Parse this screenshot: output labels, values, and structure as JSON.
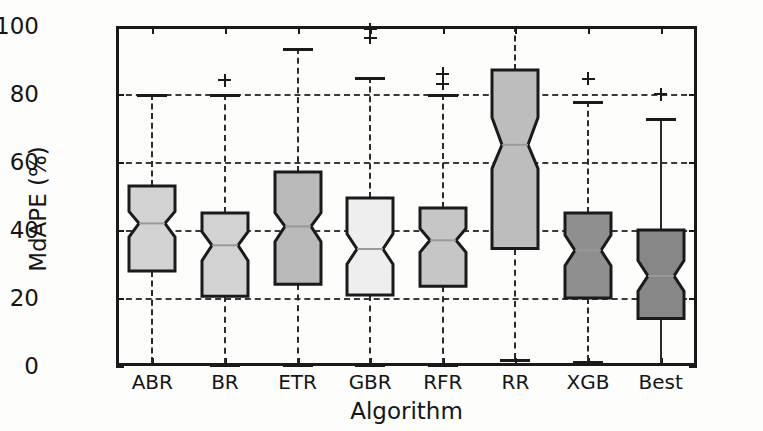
{
  "chart_data": {
    "type": "box",
    "title": "",
    "xlabel": "Algorithm",
    "ylabel": "MdAPE (%)",
    "categories": [
      "ABR",
      "BR",
      "ETR",
      "GBR",
      "RFR",
      "RR",
      "XGB",
      "Best"
    ],
    "ylim": [
      0,
      100
    ],
    "yticks": [
      0,
      20,
      40,
      60,
      80,
      100
    ],
    "ytick_labels": [
      "0",
      "20",
      "40",
      "60",
      "80",
      "100"
    ],
    "grid": true,
    "grid_axis": "y",
    "grid_style": "dashed",
    "legend": null,
    "notched": true,
    "boxes": [
      {
        "label": "ABR",
        "whisker_low": 1.0,
        "q1": 28.0,
        "median": 42.0,
        "q3": 53.0,
        "whisker_high": 80.0,
        "notch_low": 38.0,
        "notch_high": 45.5,
        "outliers": [],
        "fill": "#d2d2d2",
        "whisker_style": "dashed"
      },
      {
        "label": "BR",
        "whisker_low": 0.5,
        "q1": 20.5,
        "median": 35.5,
        "q3": 45.0,
        "whisker_high": 80.0,
        "notch_low": 31.0,
        "notch_high": 39.5,
        "outliers": [
          84.0
        ],
        "fill": "#d2d2d2",
        "whisker_style": "dashed"
      },
      {
        "label": "ETR",
        "whisker_low": 0.5,
        "q1": 24.0,
        "median": 41.0,
        "q3": 57.0,
        "whisker_high": 93.5,
        "notch_low": 36.5,
        "notch_high": 45.0,
        "outliers": [],
        "fill": "#b9b9b9",
        "whisker_style": "dashed"
      },
      {
        "label": "GBR",
        "whisker_low": 0.5,
        "q1": 21.0,
        "median": 34.5,
        "q3": 49.5,
        "whisker_high": 85.0,
        "notch_low": 30.0,
        "notch_high": 39.0,
        "outliers": [
          96.5,
          99.0
        ],
        "fill": "#eeeeee",
        "whisker_style": "dashed"
      },
      {
        "label": "RFR",
        "whisker_low": 0.5,
        "q1": 23.5,
        "median": 37.0,
        "q3": 46.5,
        "whisker_high": 80.0,
        "notch_low": 33.5,
        "notch_high": 40.5,
        "outliers": [
          83.0,
          86.0
        ],
        "fill": "#c6c6c6",
        "whisker_style": "dashed"
      },
      {
        "label": "RR",
        "whisker_low": 2.0,
        "q1": 34.5,
        "median": 65.0,
        "q3": 87.0,
        "whisker_high": 100.0,
        "notch_low": 58.0,
        "notch_high": 73.0,
        "outliers": [],
        "fill": "#bdbdbd",
        "whisker_style": "dashed"
      },
      {
        "label": "XGB",
        "whisker_low": 1.5,
        "q1": 20.0,
        "median": 34.0,
        "q3": 45.0,
        "whisker_high": 78.0,
        "notch_low": 29.5,
        "notch_high": 38.5,
        "outliers": [
          84.5
        ],
        "fill": "#8f8f8f",
        "whisker_style": "dashed"
      },
      {
        "label": "Best",
        "whisker_low": 0.0,
        "q1": 14.0,
        "median": 26.5,
        "q3": 40.0,
        "whisker_high": 73.0,
        "notch_low": 22.0,
        "notch_high": 31.0,
        "outliers": [
          80.0
        ],
        "fill": "#878787",
        "whisker_style": "solid"
      }
    ]
  },
  "colors": {
    "axis": "#1a1a1a",
    "grid": "#3a3a3a",
    "background": "#fdfdfc"
  }
}
